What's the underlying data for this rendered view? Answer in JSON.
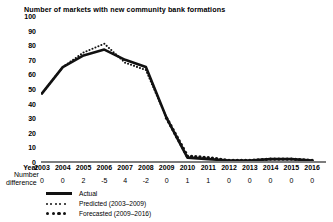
{
  "chart": {
    "title": "Number of markets with new community bank formations",
    "year_row_label": "Year",
    "diff_row_label_line1": "Number",
    "diff_row_label_line2": "difference"
  },
  "legend": {
    "position": "below-axis",
    "items": [
      {
        "label": "Actual",
        "style": "solid",
        "color": "#111111"
      },
      {
        "label": "Predicted (2003–2009)",
        "style": "fine-dotted",
        "color": "#111111"
      },
      {
        "label": "Forecasted (2009–2016)",
        "style": "thick-dotted",
        "color": "#111111"
      }
    ]
  },
  "chart_data": {
    "type": "line",
    "title": "Number of markets with new community bank formations",
    "xlabel": "Year",
    "ylabel": "",
    "ylim": [
      0,
      100
    ],
    "yticks": [
      0,
      10,
      20,
      30,
      40,
      50,
      60,
      70,
      80,
      90,
      100
    ],
    "grid": false,
    "legend_position": "below",
    "categories": [
      2003,
      2004,
      2005,
      2006,
      2007,
      2008,
      2009,
      2010,
      2011,
      2012,
      2013,
      2014,
      2015,
      2016
    ],
    "series": [
      {
        "name": "Actual",
        "style": "solid",
        "values": [
          47,
          65,
          73,
          77,
          70,
          65,
          30,
          3,
          2,
          1,
          1,
          2,
          2,
          1
        ]
      },
      {
        "name": "Predicted (2003–2009)",
        "style": "fine-dotted",
        "x": [
          2003,
          2004,
          2005,
          2006,
          2007,
          2008,
          2009
        ],
        "values": [
          47,
          65,
          75,
          81,
          68,
          63,
          30
        ]
      },
      {
        "name": "Forecasted (2009–2016)",
        "style": "thick-dotted",
        "x": [
          2009,
          2010,
          2011,
          2012,
          2013,
          2014,
          2015,
          2016
        ],
        "values": [
          30,
          4,
          3,
          1,
          1,
          2,
          2,
          1
        ]
      }
    ],
    "number_difference_row": {
      "label": "Number difference",
      "values": [
        "0",
        "0",
        "2",
        "-5",
        "4",
        "-2",
        "0",
        "1",
        "1",
        "0",
        "0",
        "0",
        "0",
        "0"
      ]
    }
  }
}
